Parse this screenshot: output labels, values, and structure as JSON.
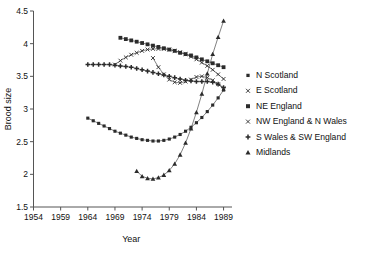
{
  "chart_data": {
    "type": "line",
    "title": "",
    "xlabel": "Year",
    "ylabel": "Brood size",
    "xlim": [
      1954,
      1990
    ],
    "ylim": [
      1.5,
      4.5
    ],
    "xticks": [
      1954,
      1959,
      1964,
      1969,
      1974,
      1979,
      1984,
      1989
    ],
    "yticks": [
      1.5,
      2,
      2.5,
      3,
      3.5,
      4,
      4.5
    ],
    "grid": false,
    "legend_position": "right",
    "series": [
      {
        "name": "N Scotland",
        "marker": "dot",
        "x": [
          1964,
          1965,
          1966,
          1967,
          1968,
          1969,
          1970,
          1971,
          1972,
          1973,
          1974,
          1975,
          1976,
          1977,
          1978,
          1979,
          1980,
          1981,
          1982,
          1983,
          1984,
          1985,
          1986,
          1987,
          1988,
          1989
        ],
        "y": [
          2.86,
          2.82,
          2.78,
          2.74,
          2.7,
          2.66,
          2.63,
          2.6,
          2.57,
          2.55,
          2.53,
          2.52,
          2.51,
          2.51,
          2.52,
          2.54,
          2.57,
          2.61,
          2.66,
          2.72,
          2.79,
          2.87,
          2.96,
          3.06,
          3.17,
          3.29
        ]
      },
      {
        "name": "E Scotland",
        "marker": "x",
        "x": [
          1969,
          1970,
          1971,
          1972,
          1973,
          1974,
          1975,
          1976,
          1977,
          1978,
          1979,
          1980,
          1981,
          1982,
          1983,
          1984,
          1985,
          1986,
          1987,
          1988,
          1989
        ],
        "y": [
          3.68,
          3.74,
          3.79,
          3.83,
          3.86,
          3.89,
          3.91,
          3.92,
          3.92,
          3.92,
          3.91,
          3.89,
          3.87,
          3.84,
          3.8,
          3.76,
          3.71,
          3.66,
          3.6,
          3.53,
          3.46
        ]
      },
      {
        "name": "NE England",
        "marker": "square",
        "x": [
          1970,
          1971,
          1972,
          1973,
          1974,
          1975,
          1976,
          1977,
          1978,
          1979,
          1980,
          1981,
          1982,
          1983,
          1984,
          1985,
          1986,
          1987,
          1988,
          1989
        ],
        "y": [
          4.09,
          4.07,
          4.05,
          4.03,
          4.01,
          3.99,
          3.97,
          3.95,
          3.93,
          3.91,
          3.89,
          3.86,
          3.84,
          3.82,
          3.79,
          3.76,
          3.73,
          3.7,
          3.67,
          3.64
        ]
      },
      {
        "name": "NW England & N Wales",
        "marker": "x",
        "x": [
          1976,
          1977,
          1978,
          1979,
          1980,
          1981,
          1982,
          1983,
          1984,
          1985,
          1986,
          1987,
          1988,
          1989
        ],
        "y": [
          3.78,
          3.64,
          3.53,
          3.45,
          3.41,
          3.4,
          3.42,
          3.45,
          3.49,
          3.5,
          3.48,
          3.44,
          3.38,
          3.31
        ]
      },
      {
        "name": "S Wales & SW England",
        "marker": "plus",
        "x": [
          1964,
          1965,
          1966,
          1967,
          1968,
          1969,
          1970,
          1971,
          1972,
          1973,
          1974,
          1975,
          1976,
          1977,
          1978,
          1979,
          1980,
          1981,
          1982,
          1983,
          1984,
          1985,
          1986,
          1987,
          1988,
          1989
        ],
        "y": [
          3.68,
          3.68,
          3.68,
          3.68,
          3.68,
          3.67,
          3.66,
          3.65,
          3.64,
          3.62,
          3.6,
          3.58,
          3.56,
          3.54,
          3.52,
          3.5,
          3.48,
          3.46,
          3.44,
          3.43,
          3.42,
          3.42,
          3.42,
          3.41,
          3.38,
          3.33
        ]
      },
      {
        "name": "Midlands",
        "marker": "triangle",
        "x": [
          1973,
          1974,
          1975,
          1976,
          1977,
          1978,
          1979,
          1980,
          1981,
          1982,
          1983,
          1984,
          1985,
          1986,
          1987,
          1988,
          1989
        ],
        "y": [
          2.05,
          1.97,
          1.94,
          1.93,
          1.95,
          1.99,
          2.06,
          2.16,
          2.3,
          2.48,
          2.7,
          2.95,
          3.23,
          3.54,
          3.84,
          4.1,
          4.35
        ]
      }
    ]
  },
  "legend": {
    "items": [
      {
        "label": "N Scotland",
        "marker": "dot"
      },
      {
        "label": "E Scotland",
        "marker": "x"
      },
      {
        "label": "NE England",
        "marker": "square"
      },
      {
        "label": "NW England & N Wales",
        "marker": "x"
      },
      {
        "label": "S Wales & SW England",
        "marker": "plus"
      },
      {
        "label": "Midlands",
        "marker": "triangle"
      }
    ]
  },
  "colors": {
    "ink": "#2b2b2b",
    "axis": "#555555",
    "background": "#ffffff"
  }
}
